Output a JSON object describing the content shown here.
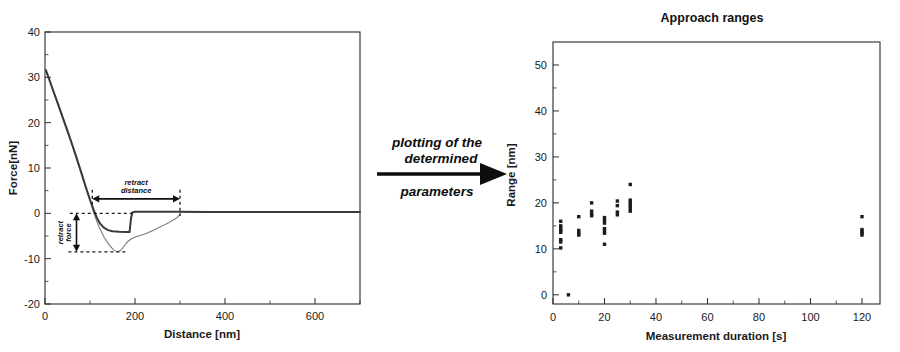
{
  "figure": {
    "flow_label_line1": "plotting of the",
    "flow_label_line2": "determined",
    "flow_label_line3": "parameters",
    "flow_arrow_icon": "right-arrow-icon"
  },
  "chart_data": [
    {
      "id": "force-distance-curve",
      "type": "line",
      "title": "",
      "xlabel": "Distance [nm]",
      "ylabel": "Force[nN]",
      "xlim": [
        0,
        700
      ],
      "ylim": [
        -20,
        40
      ],
      "xticks": [
        0,
        200,
        400,
        600
      ],
      "yticks": [
        -20,
        -10,
        0,
        10,
        20,
        30,
        40
      ],
      "xticklabels": [
        "0",
        "200",
        "400",
        "600"
      ],
      "yticklabels": [
        "-20",
        "-10",
        "0",
        "10",
        "20",
        "30",
        "40"
      ],
      "grid": false,
      "legend": "none",
      "annotations": [
        {
          "name": "retract-distance",
          "label_line1": "retract",
          "label_line2": "distance",
          "kind": "double-arrow-horizontal",
          "x_start": 105,
          "x_end": 300,
          "y": 3.2
        },
        {
          "name": "retract-force",
          "label_line1": "retract",
          "label_line2": "force",
          "kind": "double-arrow-vertical",
          "x": 70,
          "y_start": 0,
          "y_end": -8.5
        }
      ],
      "series": [
        {
          "name": "approach",
          "points": [
            [
              2,
              31.6
            ],
            [
              10,
              29.4
            ],
            [
              20,
              26.6
            ],
            [
              30,
              23.8
            ],
            [
              40,
              21.0
            ],
            [
              50,
              18.2
            ],
            [
              60,
              15.3
            ],
            [
              70,
              12.3
            ],
            [
              80,
              9.2
            ],
            [
              90,
              6.0
            ],
            [
              100,
              3.0
            ],
            [
              108,
              0.8
            ],
            [
              115,
              -0.9
            ],
            [
              122,
              -2.2
            ],
            [
              130,
              -3.1
            ],
            [
              140,
              -3.7
            ],
            [
              150,
              -3.95
            ],
            [
              165,
              -4.05
            ],
            [
              180,
              -4.1
            ],
            [
              188,
              -4.1
            ],
            [
              191,
              -1.2
            ],
            [
              194,
              0.2
            ],
            [
              200,
              0.35
            ],
            [
              240,
              0.35
            ],
            [
              280,
              0.35
            ],
            [
              300,
              0.35
            ],
            [
              360,
              0.3
            ],
            [
              420,
              0.3
            ],
            [
              500,
              0.3
            ],
            [
              600,
              0.3
            ],
            [
              700,
              0.3
            ]
          ]
        },
        {
          "name": "retract",
          "points": [
            [
              2,
              31.6
            ],
            [
              20,
              26.4
            ],
            [
              40,
              20.8
            ],
            [
              60,
              15.1
            ],
            [
              80,
              9.0
            ],
            [
              100,
              2.8
            ],
            [
              110,
              -0.4
            ],
            [
              120,
              -3.0
            ],
            [
              132,
              -5.4
            ],
            [
              143,
              -7.0
            ],
            [
              152,
              -8.0
            ],
            [
              160,
              -8.5
            ],
            [
              168,
              -8.2
            ],
            [
              176,
              -7.2
            ],
            [
              184,
              -6.2
            ],
            [
              192,
              -5.6
            ],
            [
              200,
              -5.2
            ],
            [
              212,
              -4.9
            ],
            [
              226,
              -4.4
            ],
            [
              240,
              -3.8
            ],
            [
              252,
              -3.2
            ],
            [
              264,
              -2.6
            ],
            [
              276,
              -2.0
            ],
            [
              286,
              -1.4
            ],
            [
              294,
              -0.9
            ],
            [
              299,
              -0.4
            ],
            [
              302,
              0.3
            ],
            [
              320,
              0.3
            ],
            [
              380,
              0.3
            ],
            [
              450,
              0.3
            ],
            [
              560,
              0.3
            ],
            [
              700,
              0.3
            ]
          ]
        }
      ]
    },
    {
      "id": "approach-ranges",
      "type": "scatter",
      "title": "Approach ranges",
      "xlabel": "Measurement duration [s]",
      "ylabel": "Range [nm]",
      "xlim": [
        0,
        127
      ],
      "ylim": [
        -2,
        55
      ],
      "xticks": [
        0,
        20,
        40,
        60,
        80,
        100,
        120
      ],
      "yticks": [
        0,
        10,
        20,
        30,
        40,
        50
      ],
      "xticklabels": [
        "0",
        "20",
        "40",
        "60",
        "80",
        "100",
        "120"
      ],
      "yticklabels": [
        "0",
        "10",
        "20",
        "30",
        "40",
        "50"
      ],
      "grid": false,
      "legend": "none",
      "points": [
        [
          3,
          16.0
        ],
        [
          3,
          15.0
        ],
        [
          3,
          14.5
        ],
        [
          3,
          14.0
        ],
        [
          3,
          13.6
        ],
        [
          3,
          12.0
        ],
        [
          3,
          11.5
        ],
        [
          3,
          10.2
        ],
        [
          6,
          0.0
        ],
        [
          10,
          17.0
        ],
        [
          10,
          14.0
        ],
        [
          10,
          13.4
        ],
        [
          10,
          13.0
        ],
        [
          15,
          20.0
        ],
        [
          15,
          18.2
        ],
        [
          15,
          17.6
        ],
        [
          15,
          17.2
        ],
        [
          20,
          16.8
        ],
        [
          20,
          16.2
        ],
        [
          20,
          15.6
        ],
        [
          20,
          14.4
        ],
        [
          20,
          13.9
        ],
        [
          20,
          13.4
        ],
        [
          20,
          11.0
        ],
        [
          25,
          20.4
        ],
        [
          25,
          19.4
        ],
        [
          25,
          18.0
        ],
        [
          25,
          17.4
        ],
        [
          30,
          24.0
        ],
        [
          30,
          20.6
        ],
        [
          30,
          20.0
        ],
        [
          30,
          19.4
        ],
        [
          30,
          18.8
        ],
        [
          30,
          18.2
        ],
        [
          120,
          17.0
        ],
        [
          120,
          14.2
        ],
        [
          120,
          13.8
        ],
        [
          120,
          13.4
        ],
        [
          120,
          13.0
        ]
      ]
    }
  ]
}
